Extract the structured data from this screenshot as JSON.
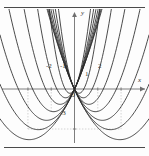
{
  "figure": {
    "type": "math-graph",
    "axis_labels": {
      "x": "x",
      "y": "y",
      "origin": "O"
    },
    "tick_labels": {
      "x": [
        "-2",
        "-1",
        "1",
        "2"
      ],
      "y": [
        "-3"
      ]
    }
  },
  "chart_data": {
    "type": "line",
    "title": "",
    "xlabel": "x",
    "ylabel": "y",
    "xlim": [
      -3.2,
      3.2
    ],
    "ylim": [
      -4.2,
      6.0
    ],
    "grid": false,
    "legend": "none",
    "xticks": [
      -2,
      -1,
      1,
      2
    ],
    "yticks": [
      -3
    ],
    "series": [
      {
        "name": "p1",
        "a": 1.0,
        "h": -1.95,
        "k": -3.8
      },
      {
        "name": "p2",
        "a": 1.25,
        "h": -1.55,
        "k": -3.05
      },
      {
        "name": "p3",
        "a": 1.6,
        "h": -1.2,
        "k": -2.35
      },
      {
        "name": "p4",
        "a": 2.1,
        "h": -0.9,
        "k": -1.7
      },
      {
        "name": "p5",
        "a": 3.0,
        "h": -0.62,
        "k": -1.15
      },
      {
        "name": "p6",
        "a": 4.6,
        "h": -0.38,
        "k": -0.66
      },
      {
        "name": "p7",
        "a": 8.0,
        "h": -0.2,
        "k": -0.32
      },
      {
        "name": "p8",
        "a": 8.0,
        "h": 0.2,
        "k": -0.32
      },
      {
        "name": "p9",
        "a": 4.6,
        "h": 0.38,
        "k": -0.66
      },
      {
        "name": "p10",
        "a": 3.0,
        "h": 0.62,
        "k": -1.15
      },
      {
        "name": "p11",
        "a": 2.1,
        "h": 0.9,
        "k": -1.7
      },
      {
        "name": "p12",
        "a": 1.6,
        "h": 1.2,
        "k": -2.35
      },
      {
        "name": "p13",
        "a": 1.25,
        "h": 1.55,
        "k": -3.05
      },
      {
        "name": "p14",
        "a": 1.0,
        "h": 1.95,
        "k": -3.8
      }
    ],
    "colors": {
      "curve": "#2b2b2b",
      "axis": "#6f6f6f",
      "guide": "#b9b9b9"
    }
  }
}
